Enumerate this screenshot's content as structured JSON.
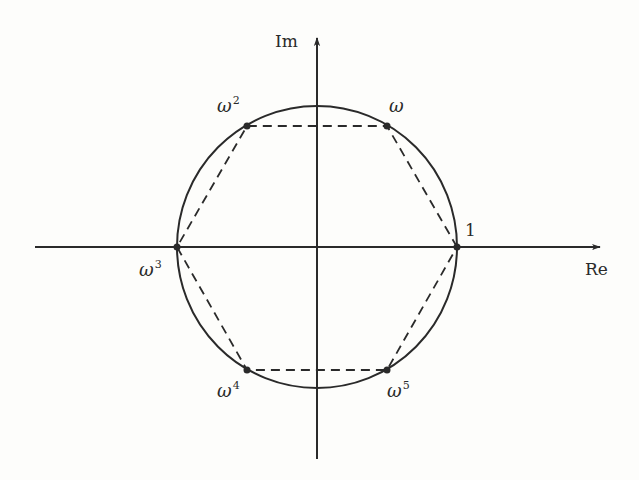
{
  "axes": {
    "x_label": "Re",
    "y_label": "Im"
  },
  "circle": {
    "description": "unit circle",
    "center": [
      0,
      0
    ],
    "radius": 1
  },
  "polygon": {
    "description": "regular hexagon (dashed) connecting the roots",
    "style": "dashed"
  },
  "colors": {
    "ink": "#2a2a2a",
    "background": "#fdfdfb"
  },
  "roots": [
    {
      "id": "1",
      "base": "1",
      "exp": "",
      "angle_deg": 0
    },
    {
      "id": "omega",
      "base": "ω",
      "exp": "",
      "angle_deg": 60
    },
    {
      "id": "omega2",
      "base": "ω",
      "exp": "2",
      "angle_deg": 120
    },
    {
      "id": "omega3",
      "base": "ω",
      "exp": "3",
      "angle_deg": 180
    },
    {
      "id": "omega4",
      "base": "ω",
      "exp": "4",
      "angle_deg": 240
    },
    {
      "id": "omega5",
      "base": "ω",
      "exp": "5",
      "angle_deg": 300
    }
  ]
}
